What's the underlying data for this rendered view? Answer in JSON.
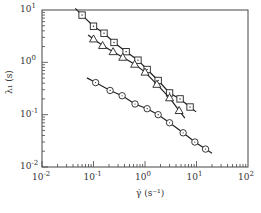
{
  "chart_data": {
    "type": "scatter",
    "title": "",
    "xlabel": "γ̇ (s⁻¹)",
    "ylabel": "λ₁ (s)",
    "xscale": "log",
    "yscale": "log",
    "xlim": [
      0.01,
      100
    ],
    "ylim": [
      0.01,
      10
    ],
    "x_ticks": [
      "10^-2",
      "10^-1",
      "10^0",
      "10^1",
      "10^2"
    ],
    "y_ticks": [
      "10^-2",
      "10^-1",
      "10^0",
      "10^1"
    ],
    "grid": false,
    "legend": null,
    "series": [
      {
        "name": "squares",
        "marker": "square",
        "fit_line": true,
        "x": [
          0.06,
          0.1,
          0.16,
          0.25,
          0.43,
          0.73,
          1.1,
          1.8,
          3.0,
          4.8,
          7.5
        ],
        "y": [
          8.0,
          4.9,
          3.6,
          2.4,
          1.6,
          1.1,
          0.73,
          0.45,
          0.26,
          0.2,
          0.14
        ]
      },
      {
        "name": "triangles",
        "marker": "triangle",
        "fit_line": true,
        "x": [
          0.1,
          0.15,
          0.24,
          0.37,
          0.63,
          1.0,
          1.7,
          3.0,
          4.6
        ],
        "y": [
          2.8,
          2.1,
          1.6,
          1.25,
          0.92,
          0.65,
          0.38,
          0.21,
          0.12
        ]
      },
      {
        "name": "circles",
        "marker": "circle",
        "fit_line": true,
        "x": [
          0.11,
          0.21,
          0.36,
          0.64,
          1.1,
          1.8,
          3.0,
          5.5,
          9.3,
          15
        ],
        "y": [
          0.41,
          0.29,
          0.23,
          0.16,
          0.13,
          0.1,
          0.07,
          0.045,
          0.03,
          0.022
        ]
      }
    ]
  },
  "axes": {
    "xlabel": "γ̇  (s⁻¹)",
    "ylabel": "λ₁ (s)",
    "x_tick_labels": [
      {
        "base": "10",
        "exp": "-2"
      },
      {
        "base": "10",
        "exp": "-1"
      },
      {
        "base": "10",
        "exp": "0"
      },
      {
        "base": "10",
        "exp": "1"
      },
      {
        "base": "10",
        "exp": "2"
      }
    ],
    "y_tick_labels": [
      {
        "base": "10",
        "exp": "-2"
      },
      {
        "base": "10",
        "exp": "-1"
      },
      {
        "base": "10",
        "exp": "0"
      },
      {
        "base": "10",
        "exp": "1"
      }
    ]
  },
  "colors": {
    "line": "#222222",
    "frame": "#444444",
    "marker_fill": "#ffffff"
  }
}
